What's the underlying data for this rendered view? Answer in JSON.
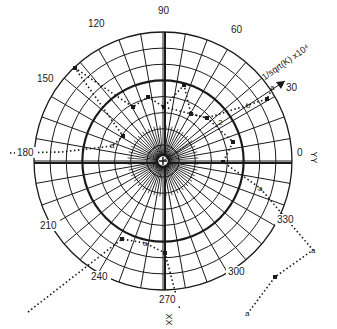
{
  "diagram": {
    "type": "polar",
    "center": [
      163,
      161
    ],
    "outer_radius": 129,
    "ring_count": 8,
    "thick_ring_index": 5,
    "spoke_step_deg": 10,
    "inner_spoke_step_deg": 5,
    "angle_labels": [
      {
        "text": "0",
        "x": 297,
        "y": 156
      },
      {
        "text": "30",
        "x": 286,
        "y": 91
      },
      {
        "text": "60",
        "x": 231,
        "y": 33
      },
      {
        "text": "90",
        "x": 158,
        "y": 14
      },
      {
        "text": "120",
        "x": 88,
        "y": 27
      },
      {
        "text": "150",
        "x": 37,
        "y": 82
      },
      {
        "text": "180",
        "x": 17,
        "y": 156
      },
      {
        "text": "210",
        "x": 40,
        "y": 229
      },
      {
        "text": "240",
        "x": 91,
        "y": 280
      },
      {
        "text": "270",
        "x": 159,
        "y": 303
      },
      {
        "text": "300",
        "x": 228,
        "y": 275
      },
      {
        "text": "330",
        "x": 277,
        "y": 223
      }
    ],
    "axis_labels": {
      "yy": {
        "text": "YY",
        "x": 307,
        "y": 153
      },
      "xx": {
        "text": "XX",
        "x": 162,
        "y": 315
      },
      "radial": {
        "text": "1/sqrt(K) x10⁴"
      }
    },
    "radial_arrow": {
      "from": [
        163,
        161
      ],
      "to": [
        285,
        81
      ]
    },
    "series": [
      {
        "name": "upper-left path",
        "points": [
          [
            10,
            153
          ],
          [
            62,
            152
          ],
          [
            112,
            146
          ],
          [
            123,
            136
          ],
          [
            75,
            68
          ],
          [
            133,
            107
          ],
          [
            148,
            97
          ],
          [
            164,
            107
          ],
          [
            184,
            85
          ],
          [
            191,
            114
          ],
          [
            207,
            118
          ],
          [
            248,
            105
          ],
          [
            267,
            99
          ],
          [
            273,
            87
          ]
        ],
        "point_labels": [
          {
            "text": "a",
            "x": 110,
            "y": 148
          }
        ]
      },
      {
        "name": "right path",
        "points": [
          [
            164,
            107
          ],
          [
            207,
            118
          ],
          [
            233,
            142
          ],
          [
            223,
            162
          ],
          [
            260,
            188
          ],
          [
            313,
            250
          ],
          [
            275,
            277
          ],
          [
            248,
            313
          ]
        ],
        "point_labels": [
          {
            "text": "2",
            "x": 218,
            "y": 125
          },
          {
            "text": "b",
            "x": 246,
            "y": 108
          },
          {
            "text": "a",
            "x": 270,
            "y": 90
          },
          {
            "text": "a",
            "x": 258,
            "y": 191
          },
          {
            "text": "a",
            "x": 311,
            "y": 253
          },
          {
            "text": "a",
            "x": 245,
            "y": 316
          }
        ]
      },
      {
        "name": "lower path",
        "points": [
          [
            28,
            312
          ],
          [
            122,
            239
          ],
          [
            145,
            243
          ],
          [
            165,
            253
          ],
          [
            180,
            310
          ]
        ],
        "point_labels": [
          {
            "text": "a",
            "x": 143,
            "y": 246
          }
        ]
      }
    ],
    "markers": [
      [
        75,
        68
      ],
      [
        133,
        107
      ],
      [
        148,
        97
      ],
      [
        164,
        107
      ],
      [
        184,
        85
      ],
      [
        191,
        114
      ],
      [
        207,
        118
      ],
      [
        267,
        99
      ],
      [
        123,
        136
      ],
      [
        233,
        142
      ],
      [
        223,
        162
      ],
      [
        122,
        239
      ],
      [
        165,
        253
      ],
      [
        275,
        277
      ]
    ],
    "line_color": "#1a1a1a",
    "background": "#ffffff"
  }
}
